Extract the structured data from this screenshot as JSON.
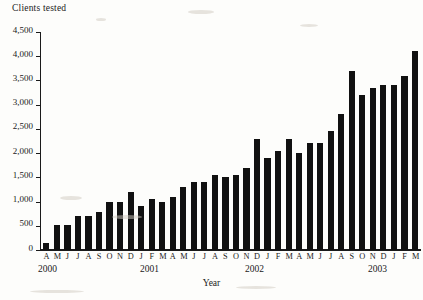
{
  "chart_data": {
    "type": "bar",
    "title": "Clients tested",
    "xlabel": "Year",
    "ylabel": "Clients tested",
    "ylim": [
      0,
      4500
    ],
    "ytick_labels": [
      "4,500",
      "4,000",
      "3,500",
      "3,000",
      "2,500",
      "2,000",
      "1,500",
      "1,000",
      "500",
      "0"
    ],
    "ytick_values": [
      4500,
      4000,
      3500,
      3000,
      2500,
      2000,
      1500,
      1000,
      500,
      0
    ],
    "grid": false,
    "legend": null,
    "categories": [
      "A",
      "M",
      "J",
      "J",
      "A",
      "S",
      "O",
      "N",
      "D",
      "J",
      "F",
      "M",
      "A",
      "M",
      "J",
      "J",
      "A",
      "S",
      "O",
      "N",
      "D",
      "J",
      "F",
      "M",
      "A",
      "M",
      "J",
      "J",
      "A",
      "S",
      "O",
      "N",
      "D",
      "J",
      "F",
      "M"
    ],
    "values": [
      150,
      520,
      520,
      700,
      700,
      780,
      1000,
      1000,
      1200,
      900,
      1050,
      1000,
      1100,
      1300,
      1400,
      1400,
      1550,
      1500,
      1550,
      1700,
      2300,
      1900,
      2050,
      2300,
      2000,
      2200,
      2200,
      2450,
      2800,
      3700,
      3200,
      3350,
      3400,
      3400,
      3600,
      4100
    ],
    "year_groups": [
      {
        "label": "2000",
        "months": [
          "A",
          "M",
          "J",
          "J",
          "A",
          "S",
          "O",
          "N",
          "D"
        ]
      },
      {
        "label": "2001",
        "months": [
          "J",
          "F",
          "M",
          "A",
          "M",
          "J",
          "J",
          "A",
          "S",
          "O",
          "N",
          "D"
        ]
      },
      {
        "label": "2002",
        "months": [
          "J",
          "F",
          "M",
          "A",
          "M",
          "J",
          "J",
          "A",
          "S",
          "O",
          "N",
          "D"
        ]
      },
      {
        "label": "2003",
        "months": [
          "J",
          "F",
          "M"
        ]
      }
    ],
    "year_label_left_px": [
      38,
      140,
      245,
      368
    ],
    "colors": {
      "bar": "#111111",
      "axis": "#1a1a1a",
      "background": "#fdfdfb"
    }
  }
}
